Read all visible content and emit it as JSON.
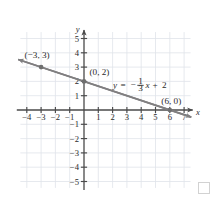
{
  "figure": {
    "kind": "coordinate-plane-line-graph",
    "axis_labels": {
      "x": "x",
      "y": "y"
    },
    "colors": {
      "grid": "#dfe3ea",
      "axis": "#4a4a4a",
      "line": "#807f80",
      "point": "#6f6f6f",
      "text": "#2b2b2b",
      "corner_square": "#d2d2d2"
    },
    "x_ticks": [
      "-4",
      "-3",
      "-2",
      "-1",
      "1",
      "2",
      "3",
      "4",
      "5",
      "6",
      "7"
    ],
    "y_ticks": [
      "5",
      "4",
      "3",
      "2",
      "1",
      "-1",
      "-2",
      "-3",
      "-4",
      "-5"
    ],
    "equation_label": {
      "lhs": "y",
      "equals": "=",
      "sign": "−",
      "numerator": "1",
      "denominator": "3",
      "variable": "x",
      "plus": "+",
      "constant": "2"
    },
    "annotations": [
      {
        "name": "point-label-neg3-3",
        "text": "(−3, 3)"
      },
      {
        "name": "point-label-0-2",
        "text": "(0, 2)"
      },
      {
        "name": "point-label-6-0",
        "text": "(6, 0)"
      }
    ]
  },
  "chart_data": {
    "type": "line",
    "title": "",
    "xlabel": "x",
    "ylabel": "y",
    "xlim": [
      -4.7,
      7.6
    ],
    "ylim": [
      -5.6,
      5.6
    ],
    "grid": true,
    "legend": "none",
    "equation": "y = -1/3 x + 2",
    "slope": -0.3333333333,
    "intercept": 2,
    "xticks": [
      -4,
      -3,
      -2,
      -1,
      1,
      2,
      3,
      4,
      5,
      6,
      7
    ],
    "yticks": [
      5,
      4,
      3,
      2,
      1,
      -1,
      -2,
      -3,
      -4,
      -5
    ],
    "series": [
      {
        "name": "y = -1/3 x + 2",
        "x": [
          -4.6,
          7.5
        ],
        "y": [
          3.5333,
          -0.5
        ],
        "arrow_start": true,
        "arrow_end": true
      }
    ],
    "points": [
      {
        "x": -3,
        "y": 3,
        "label": "(−3, 3)",
        "marked": true
      },
      {
        "x": 0,
        "y": 2,
        "label": "(0, 2)",
        "marked": true
      },
      {
        "x": 6,
        "y": 0,
        "label": "(6, 0)",
        "marked": true
      }
    ],
    "annotations": [
      {
        "text": "y = -1/3 x + 2",
        "x": 3.0,
        "y": 1.55
      }
    ]
  }
}
